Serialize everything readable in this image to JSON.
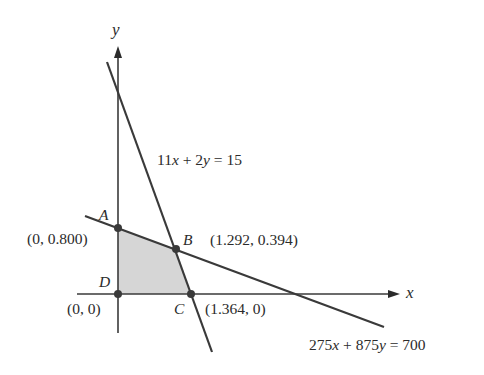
{
  "figure": {
    "axes": {
      "x_label": "x",
      "y_label": "y"
    },
    "constraints": [
      {
        "id": "line1",
        "equation": "11x + 2y = 15",
        "display": {
          "a": "11",
          "v1": "x",
          "op": " + ",
          "b": "2",
          "v2": "y",
          "rhs": " = 15"
        }
      },
      {
        "id": "line2",
        "equation": "275x + 875y = 700",
        "display": {
          "a": "275",
          "v1": "x",
          "op": " + ",
          "b": "875",
          "v2": "y",
          "rhs": " = 700"
        }
      }
    ],
    "vertices": [
      {
        "name": "A",
        "coords": "(0, 0.800)"
      },
      {
        "name": "B",
        "coords": "(1.292, 0.394)"
      },
      {
        "name": "C",
        "coords": "(1.364, 0)"
      },
      {
        "name": "D",
        "coords": "(0, 0)"
      }
    ],
    "feasible_region": {
      "fill": "#d6d6d6",
      "vertices": [
        "A",
        "B",
        "C",
        "D"
      ]
    },
    "colors": {
      "line": "#3a3a3a",
      "text": "#2b2b2b",
      "region": "#d6d6d6"
    }
  }
}
